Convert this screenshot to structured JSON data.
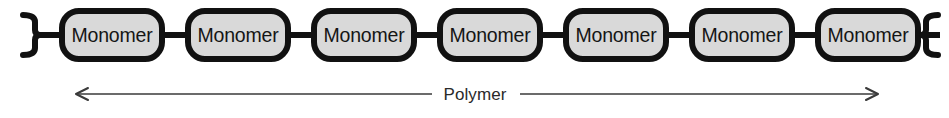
{
  "figure": {
    "background_color": "#ffffff"
  },
  "chain": {
    "unit_label": "Monomer",
    "unit_count": 7,
    "units": [
      {
        "label": "Monomer"
      },
      {
        "label": "Monomer"
      },
      {
        "label": "Monomer"
      },
      {
        "label": "Monomer"
      },
      {
        "label": "Monomer"
      },
      {
        "label": "Monomer"
      },
      {
        "label": "Monomer"
      }
    ],
    "capsule_fill": "#d9d9d9",
    "capsule_stroke": "#111111",
    "bond_color": "#111111",
    "left_bracket": ")",
    "right_bracket": "("
  },
  "annotation": {
    "label": "Polymer",
    "arrow_color": "#3a3a3a",
    "arrow_style": "double-headed"
  }
}
